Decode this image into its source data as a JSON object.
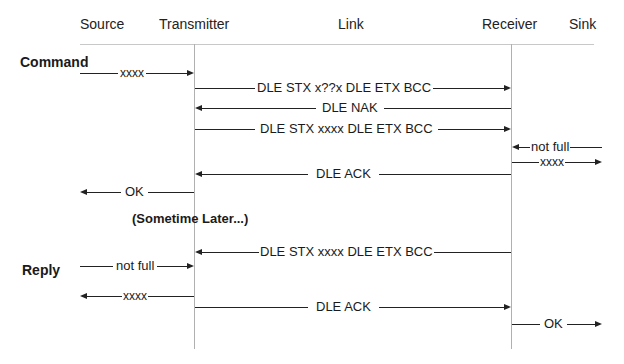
{
  "participants": [
    {
      "id": "source",
      "label": "Source"
    },
    {
      "id": "transmitter",
      "label": "Transmitter"
    },
    {
      "id": "link",
      "label": "Link"
    },
    {
      "id": "receiver",
      "label": "Receiver"
    },
    {
      "id": "sink",
      "label": "Sink"
    }
  ],
  "sections": {
    "command": "Command",
    "reply": "Reply"
  },
  "note": "(Sometime Later...)",
  "messages": [
    {
      "from": "source",
      "to": "transmitter",
      "label": "xxxx"
    },
    {
      "from": "transmitter",
      "to": "receiver",
      "label": "DLE STX x??x DLE ETX BCC"
    },
    {
      "from": "receiver",
      "to": "transmitter",
      "label": "DLE NAK"
    },
    {
      "from": "transmitter",
      "to": "receiver",
      "label": "DLE STX xxxx DLE ETX BCC"
    },
    {
      "from": "sink",
      "to": "receiver",
      "label": "not full"
    },
    {
      "from": "receiver",
      "to": "sink",
      "label": "xxxx"
    },
    {
      "from": "receiver",
      "to": "transmitter",
      "label": "DLE ACK"
    },
    {
      "from": "transmitter",
      "to": "source",
      "label": "OK"
    },
    {
      "from": "receiver",
      "to": "transmitter",
      "label": "DLE STX xxxx DLE ETX BCC"
    },
    {
      "from": "source",
      "to": "transmitter",
      "label": "not full"
    },
    {
      "from": "transmitter",
      "to": "source",
      "label": "xxxx"
    },
    {
      "from": "transmitter",
      "to": "receiver",
      "label": "DLE ACK"
    },
    {
      "from": "receiver",
      "to": "sink",
      "label": "OK"
    }
  ]
}
